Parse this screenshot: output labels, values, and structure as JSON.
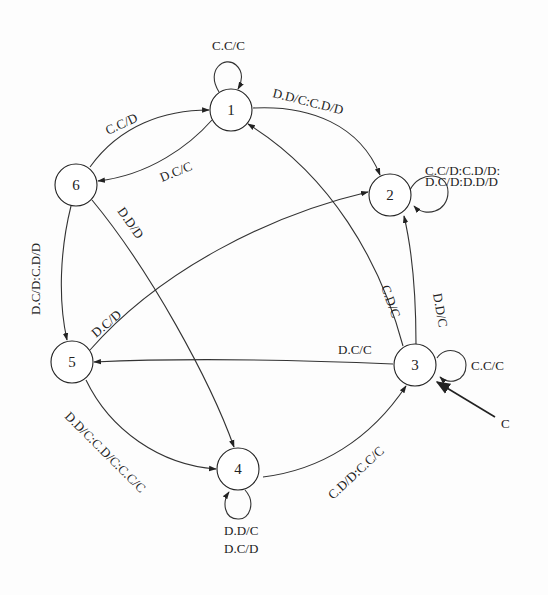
{
  "diagram": {
    "type": "state-machine",
    "nodes": [
      {
        "id": "1",
        "label": "1"
      },
      {
        "id": "2",
        "label": "2"
      },
      {
        "id": "3",
        "label": "3"
      },
      {
        "id": "4",
        "label": "4"
      },
      {
        "id": "5",
        "label": "5"
      },
      {
        "id": "6",
        "label": "6"
      }
    ],
    "start": {
      "label": "C",
      "target": "3"
    },
    "edges": [
      {
        "from": "1",
        "to": "1",
        "label": "C.C/C"
      },
      {
        "from": "1",
        "to": "2",
        "label": "D.D/C:C.D/D"
      },
      {
        "from": "1",
        "to": "6",
        "label": "D.C/C"
      },
      {
        "from": "6",
        "to": "1",
        "label": "C.C/D"
      },
      {
        "from": "2",
        "to": "2",
        "label_line1": "C.C/D:C.D/D:",
        "label_line2": "D.C/D:D.D/D"
      },
      {
        "from": "6",
        "to": "5",
        "label": "D.C/D:C.D/D"
      },
      {
        "from": "6",
        "to": "4",
        "label": "D.D/D"
      },
      {
        "from": "5",
        "to": "2",
        "label": "D.C/D"
      },
      {
        "from": "3",
        "to": "1",
        "label": "C.D/C"
      },
      {
        "from": "3",
        "to": "2",
        "label": "D.D/C"
      },
      {
        "from": "3",
        "to": "3",
        "label": "C.C/C"
      },
      {
        "from": "3",
        "to": "5",
        "label": "D.C/C"
      },
      {
        "from": "5",
        "to": "4",
        "label": "D.D/C:C.D/C:C.C/C"
      },
      {
        "from": "4",
        "to": "3",
        "label": "C.D/D:C.C/C"
      },
      {
        "from": "4",
        "to": "4",
        "label_line1": "D.D/C",
        "label_line2": "D.C/D"
      }
    ]
  }
}
